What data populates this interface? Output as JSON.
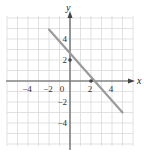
{
  "chart_data": {
    "type": "line",
    "title": "",
    "xlabel": "x",
    "ylabel": "y",
    "xlim": [
      -6,
      6
    ],
    "ylim": [
      -6,
      6
    ],
    "grid": true,
    "x_ticks": [
      {
        "value": -4,
        "label": "−4"
      },
      {
        "value": -2,
        "label": "−2"
      },
      {
        "value": 0,
        "label": "0"
      },
      {
        "value": 2,
        "label": "2"
      },
      {
        "value": 4,
        "label": "4"
      }
    ],
    "y_ticks": [
      {
        "value": 4,
        "label": "4"
      },
      {
        "value": 2,
        "label": "2"
      },
      {
        "value": -2,
        "label": "−2"
      },
      {
        "value": -4,
        "label": "−4"
      }
    ],
    "series": [
      {
        "name": "line",
        "color": "#9a9a9a",
        "x": [
          -2,
          5
        ],
        "y": [
          4.9,
          -3
        ]
      }
    ],
    "points": [
      {
        "x": 0,
        "y": 2,
        "label": "y-intercept"
      },
      {
        "x": 2,
        "y": 0,
        "label": "x-intercept"
      }
    ]
  },
  "colors": {
    "grid": "#d9d9d9",
    "axis": "#555555",
    "line": "#9a9a9a",
    "point": "#444444"
  }
}
